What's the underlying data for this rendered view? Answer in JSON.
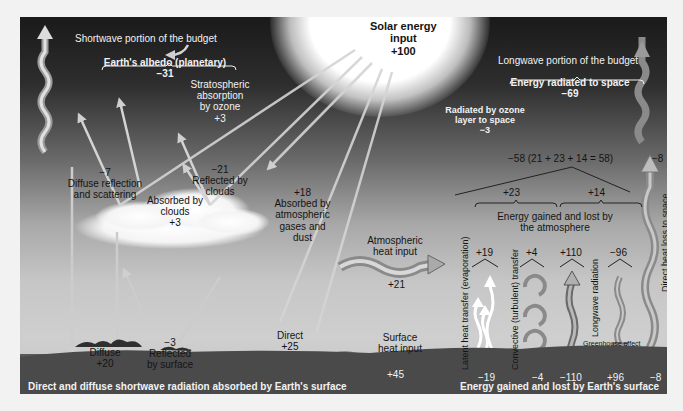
{
  "sun": {
    "title": "Solar energy",
    "title2": "input",
    "value": "+100"
  },
  "shortwave": {
    "header": "Shortwave portion of the budget",
    "albedo_label": "Earth's albedo (planetary)",
    "albedo_value": "−31",
    "stratospheric": {
      "l1": "Stratospheric",
      "l2": "absorption",
      "l3": "by ozone",
      "value": "+3"
    },
    "diffuse_reflection": {
      "value": "−7",
      "l1": "Diffuse reflection",
      "l2": "and scattering"
    },
    "reflected_clouds": {
      "value": "−21",
      "l1": "Reflected by",
      "l2": "clouds"
    },
    "absorbed_clouds": {
      "l1": "Absorbed by",
      "l2": "clouds",
      "value": "+3"
    },
    "absorbed_gases": {
      "value": "+18",
      "l1": "Absorbed by",
      "l2": "atmospheric",
      "l3": "gases and",
      "l4": "dust"
    },
    "diffuse": {
      "l1": "Diffuse",
      "value": "+20"
    },
    "reflected_surface": {
      "value": "−3",
      "l1": "Reflected",
      "l2": "by surface"
    },
    "direct": {
      "l1": "Direct",
      "value": "+25"
    },
    "footer": "Direct and diffuse shortwave radiation absorbed by Earth's surface"
  },
  "longwave": {
    "header": "Longwave portion of the budget",
    "radiated_label": "Energy radiated to space",
    "radiated_value": "−69",
    "ozone": {
      "l1": "Radiated by ozone",
      "l2": "layer to space",
      "value": "−3"
    },
    "sum_equation": "−58 (21 + 23 + 14 = 58)",
    "direct_loss_value": "−8",
    "direct_loss_label": "Direct heat loss to space",
    "atm_heat": {
      "l1": "Atmospheric",
      "l2": "heat input",
      "value": "+21"
    },
    "surface_heat": {
      "l1": "Surface",
      "l2": "heat input",
      "value": "+45"
    },
    "gain_23": "+23",
    "gain_14": "+14",
    "atmos_label_1": "Energy gained and lost by",
    "atmos_label_2": "the atmosphere",
    "fluxes": [
      {
        "top": "+19",
        "bottom": "−19",
        "label": "Latent heat transfer (evaporation)"
      },
      {
        "top": "+4",
        "bottom": "−4",
        "label": "Convective (turbulent) transfer"
      },
      {
        "top": "+110",
        "bottom": "−110",
        "label": "Longwave radiation"
      },
      {
        "top": "−96",
        "bottom": "+96",
        "label": ""
      }
    ],
    "greenhouse": "Greenhouse effect",
    "footer": "Energy gained and lost by Earth's surface"
  },
  "colors": {
    "arrow_light": "#d9d9d9",
    "arrow_dark": "#7a7a7a",
    "sky_top": "#1a1a1a",
    "ground": "#3a3a3a"
  }
}
